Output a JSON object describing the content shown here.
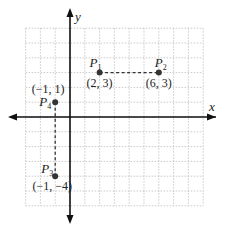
{
  "diagram": {
    "type": "coordinate-plane",
    "axes": {
      "x_label": "x",
      "y_label": "y"
    },
    "grid": {
      "x_min": -3,
      "x_max": 9,
      "y_min": -6,
      "y_max": 6,
      "step": 1
    },
    "points": [
      {
        "id": "P1",
        "name": "P",
        "sub": "1",
        "x": 2,
        "y": 3,
        "coord_label": "(2, 3)"
      },
      {
        "id": "P2",
        "name": "P",
        "sub": "2",
        "x": 6,
        "y": 3,
        "coord_label": "(6, 3)"
      },
      {
        "id": "P3",
        "name": "P",
        "sub": "3",
        "x": -1,
        "y": -4,
        "coord_label": "(−1, −4)"
      },
      {
        "id": "P4",
        "name": "P",
        "sub": "4",
        "x": -1,
        "y": 1,
        "coord_label": "(−1, 1)"
      }
    ],
    "segments": [
      {
        "from": "P1",
        "to": "P2",
        "style": "dashed"
      },
      {
        "from": "P4",
        "to": "P3",
        "style": "dashed"
      }
    ],
    "colors": {
      "axis": "#111111",
      "grid": "#bdbdbd",
      "point": "#333333",
      "dash": "#333333"
    }
  }
}
